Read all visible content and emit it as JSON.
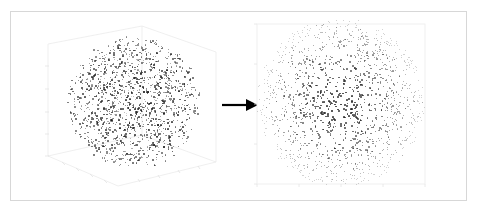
{
  "figure": {
    "background_color": "#ffffff",
    "border_color": "#d7d7d7",
    "point_color": "#1b1b1b",
    "axis_line_color": "#e6e6e6",
    "arrow_color": "#000000",
    "left_panel_label": "",
    "right_panel_label": "",
    "arrow_glyph": "→"
  },
  "chart_data": [
    {
      "type": "scatter",
      "name": "3d-sphere-scatter",
      "projection": "3d",
      "title": "",
      "xlabel": "",
      "ylabel": "",
      "zlabel": "",
      "n_points": 1400,
      "distribution": "uniform-in-ball",
      "marker_color": "#1b1b1b",
      "marker_size": 1.6,
      "grid": true,
      "xlim": [
        -1,
        1
      ],
      "ylim": [
        -1,
        1
      ],
      "zlim": [
        -1,
        1
      ],
      "xticks": [
        -1,
        -0.5,
        0,
        0.5,
        1
      ],
      "yticks": [
        -1,
        -0.5,
        0,
        0.5,
        1
      ],
      "zticks": [
        -1,
        -0.5,
        0,
        0.5,
        1
      ],
      "xticklabels": [
        "",
        "",
        "",
        "",
        ""
      ],
      "yticklabels": [
        "",
        "",
        "",
        "",
        ""
      ],
      "zticklabels": [
        "",
        "",
        "",
        "",
        ""
      ],
      "center_px": [
        116,
        87
      ],
      "radius_px": 67,
      "legend": null,
      "annotations": []
    },
    {
      "type": "scatter",
      "name": "2d-disk-scatter",
      "projection": "rectilinear",
      "title": "",
      "xlabel": "",
      "ylabel": "",
      "n_points": 1400,
      "distribution": "uniform-in-disk",
      "marker_color": "#1b1b1b",
      "marker_size": 1.6,
      "grid": false,
      "xlim": [
        -1,
        1
      ],
      "ylim": [
        -1,
        1
      ],
      "xticks": [
        -1,
        -0.5,
        0,
        0.5,
        1
      ],
      "yticks": [
        -1,
        -0.5,
        0,
        0.5,
        1
      ],
      "xticklabels": [
        "",
        "",
        "",
        "",
        ""
      ],
      "yticklabels": [
        "",
        "",
        "",
        "",
        ""
      ],
      "center_px": [
        91,
        91
      ],
      "radius_px": 84,
      "frame": true,
      "legend": null,
      "annotations": []
    }
  ],
  "transform": {
    "direction": "left-to-right",
    "description": "arrow"
  }
}
